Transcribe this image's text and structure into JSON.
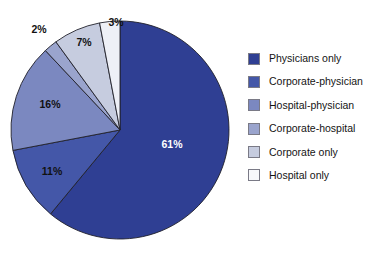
{
  "chart_data": {
    "type": "pie",
    "title": "",
    "subtitle": "",
    "xlabel": "",
    "ylabel": "",
    "legend_position": "right",
    "grid": false,
    "categories": [
      "Physicians only",
      "Corporate-physician",
      "Hospital-physician",
      "Corporate-hospital",
      "Corporate only",
      "Hospital only"
    ],
    "values": [
      61,
      11,
      16,
      2,
      7,
      3
    ],
    "value_labels": [
      "61%",
      "11%",
      "16%",
      "2%",
      "7%",
      "3%"
    ],
    "colors": [
      "#2f3f93",
      "#4457a8",
      "#7b88c0",
      "#9aa4cd",
      "#c6ccdf",
      "#eef0f7"
    ],
    "slices": [
      {
        "name": "Physicians only",
        "value": 61,
        "label": "61%",
        "color": "#2f3f93",
        "label_color": "#ffffff",
        "label_x": 172,
        "label_y": 148
      },
      {
        "name": "Corporate-physician",
        "value": 11,
        "label": "11%",
        "color": "#4457a8",
        "label_color": "#111111",
        "label_x": 52,
        "label_y": 175
      },
      {
        "name": "Hospital-physician",
        "value": 16,
        "label": "16%",
        "color": "#7b88c0",
        "label_color": "#111111",
        "label_x": 50,
        "label_y": 108
      },
      {
        "name": "Corporate-hospital",
        "value": 2,
        "label": "2%",
        "color": "#9aa4cd",
        "label_color": "#111111",
        "label_x": 39,
        "label_y": 33
      },
      {
        "name": "Corporate only",
        "value": 7,
        "label": "7%",
        "color": "#c6ccdf",
        "label_color": "#111111",
        "label_x": 84,
        "label_y": 46
      },
      {
        "name": "Hospital only",
        "value": 3,
        "label": "3%",
        "color": "#eef0f7",
        "label_color": "#111111",
        "label_x": 116,
        "label_y": 26
      }
    ],
    "geometry": {
      "cx": 120,
      "cy": 130,
      "r": 109,
      "start_angle_deg": 0,
      "direction": "clockwise-for-first-then-counterclockwise"
    }
  },
  "legend": {
    "items": [
      {
        "label": "Physicians only",
        "color": "#2f3f93"
      },
      {
        "label": "Corporate-physician",
        "color": "#4457a8"
      },
      {
        "label": "Hospital-physician",
        "color": "#7b88c0"
      },
      {
        "label": "Corporate-hospital",
        "color": "#9aa4cd"
      },
      {
        "label": "Corporate only",
        "color": "#c6ccdf"
      },
      {
        "label": "Hospital only",
        "color": "#f7f8fb"
      }
    ]
  }
}
